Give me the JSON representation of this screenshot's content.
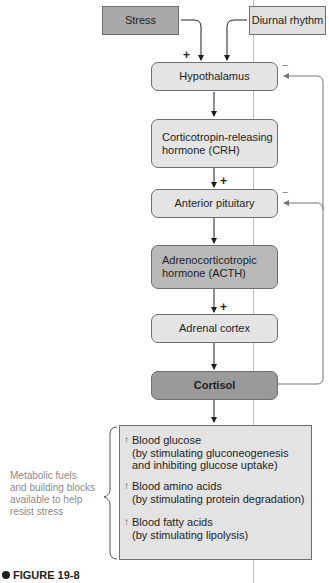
{
  "diagram": {
    "inputs": {
      "stress": "Stress",
      "diurnal": "Diurnal rhythm"
    },
    "nodes": [
      {
        "id": "hypothalamus",
        "label": "Hypothalamus"
      },
      {
        "id": "crh",
        "label": "Corticotropin-releasing hormone (CRH)",
        "line1": "Corticotropin-releasing",
        "line2": "hormone (CRH)"
      },
      {
        "id": "anterior_pituitary",
        "label": "Anterior pituitary"
      },
      {
        "id": "acth",
        "label": "Adrenocorticotropic hormone (ACTH)",
        "line1": "Adrenocorticotropic",
        "line2": "hormone (ACTH)"
      },
      {
        "id": "adrenal_cortex",
        "label": "Adrenal cortex"
      },
      {
        "id": "cortisol",
        "label": "Cortisol"
      }
    ],
    "signs": {
      "stress_plus": "+",
      "crh_plus": "+",
      "acth_plus": "+",
      "feedback_hypothalamus": "−",
      "feedback_pituitary": "−"
    },
    "effects": [
      {
        "arrow": "↑",
        "title": "Blood glucose",
        "detail1": "(by stimulating gluconeogenesis",
        "detail2": "and inhibiting glucose uptake)"
      },
      {
        "arrow": "↑",
        "title": "Blood amino acids",
        "detail1": "(by stimulating protein degradation)",
        "detail2": ""
      },
      {
        "arrow": "↑",
        "title": "Blood fatty acids",
        "detail1": "(by stimulating lipolysis)",
        "detail2": ""
      }
    ],
    "side_note": [
      "Metabolic fuels",
      "and building blocks",
      "available to help",
      "resist stress"
    ],
    "figure_label": "FIGURE 19-8"
  }
}
